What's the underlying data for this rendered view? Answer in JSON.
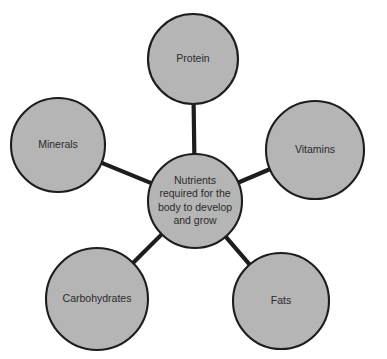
{
  "diagram": {
    "type": "spider-map",
    "background_color": "#ffffff",
    "node_fill_color": "#b5b5b5",
    "node_stroke_color": "#1d1d1d",
    "text_color": "#2b2b2b",
    "center": {
      "label": "Nutrients required for the body to develop and grow",
      "lines": [
        "Nutrients",
        "required for the",
        "body to develop",
        "and grow"
      ],
      "cx": 195,
      "cy": 201,
      "r": 47
    },
    "nodes": [
      {
        "label": "Protein",
        "cx": 193,
        "cy": 59,
        "r": 45
      },
      {
        "label": "Vitamins",
        "cx": 315,
        "cy": 150,
        "r": 49
      },
      {
        "label": "Minerals",
        "cx": 58,
        "cy": 145,
        "r": 47
      },
      {
        "label": "Carbohydrates",
        "cx": 97,
        "cy": 299,
        "r": 51
      },
      {
        "label": "Fats",
        "cx": 281,
        "cy": 301,
        "r": 48
      }
    ],
    "connections": [
      {
        "from": "center",
        "to": "Protein"
      },
      {
        "from": "center",
        "to": "Vitamins"
      },
      {
        "from": "center",
        "to": "Minerals"
      },
      {
        "from": "center",
        "to": "Carbohydrates"
      },
      {
        "from": "center",
        "to": "Fats"
      }
    ]
  }
}
